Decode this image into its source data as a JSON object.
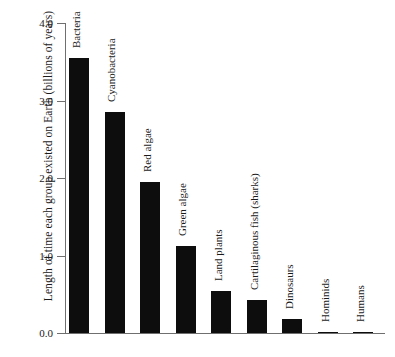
{
  "chart_data": {
    "type": "bar",
    "title": "",
    "xlabel": "",
    "ylabel": "Length of time each group existed on Earth (billions of years)",
    "ylim": [
      0.0,
      4.0
    ],
    "yticks": [
      "0.0",
      "1.0",
      "2.0",
      "3.0",
      "4.0"
    ],
    "ytick_values": [
      0.0,
      1.0,
      2.0,
      3.0,
      4.0
    ],
    "grid": false,
    "legend": "none",
    "bar_color": "#0d0d0d",
    "categories": [
      "Bacteria",
      "Cyanobacteria",
      "Red algae",
      "Green algae",
      "Land plants",
      "Cartilaginous fish (sharks)",
      "Dinosaurs",
      "Hominids",
      "Humans"
    ],
    "values": [
      3.55,
      2.85,
      1.95,
      1.12,
      0.54,
      0.43,
      0.18,
      0.005,
      0.002
    ]
  }
}
